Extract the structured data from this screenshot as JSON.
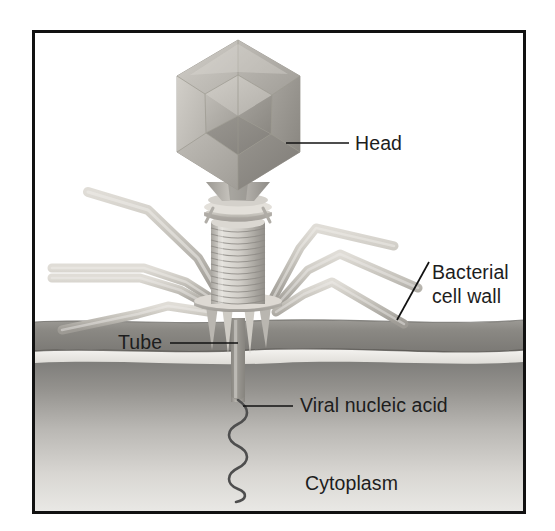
{
  "figure": {
    "frame_color": "#111111",
    "background_color": "#ffffff"
  },
  "labels": [
    {
      "id": "head",
      "text": "Head",
      "x": 355,
      "y": 150
    },
    {
      "id": "bacterial_wall",
      "line1": "Bacterial",
      "line2": "cell wall",
      "x": 432,
      "y": 279
    },
    {
      "id": "tube",
      "text": "Tube",
      "x": 118,
      "y": 349
    },
    {
      "id": "viral_nucleic",
      "text": "Viral nucleic acid",
      "x": 300,
      "y": 412
    },
    {
      "id": "cytoplasm",
      "text": "Cytoplasm",
      "x": 305,
      "y": 490
    }
  ],
  "regions": {
    "cell_wall": {
      "name": "Bacterial cell wall",
      "color": "#8d8d8d",
      "top_y": 320,
      "bottom_y": 352
    },
    "periplasm_gap": {
      "name": "light gap",
      "color": "#f0efec",
      "top_y": 352,
      "bottom_y": 362
    },
    "cytoplasm": {
      "name": "Cytoplasm",
      "color_top": "#8b8b8b",
      "color_bottom": "#e6e5e2",
      "top_y": 362,
      "bottom_y": 512
    }
  },
  "virus_parts": [
    {
      "id": "head",
      "name": "Icosahedral capsid head",
      "color": "#b5b2ac"
    },
    {
      "id": "neck",
      "name": "Neck / funnel",
      "color": "#b7b4ae"
    },
    {
      "id": "collar",
      "name": "Collar with whiskers",
      "color": "#cecbc4"
    },
    {
      "id": "sheath",
      "name": "Contractile ringed sheath",
      "color": "#c9c6bf",
      "ring_count": 13
    },
    {
      "id": "base_plate",
      "name": "Base plate",
      "color": "#c9c6bf"
    },
    {
      "id": "spikes",
      "name": "Tail spikes",
      "color": "#bdbab3",
      "count": 4
    },
    {
      "id": "tail_fibers",
      "name": "Tail fibers",
      "color": "#c5c2bb",
      "count": 7
    },
    {
      "id": "tube",
      "name": "Tail tube penetrating wall",
      "color": "#9a9791"
    },
    {
      "id": "nucleic_acid",
      "name": "Viral nucleic acid strand",
      "color": "#545454"
    }
  ]
}
